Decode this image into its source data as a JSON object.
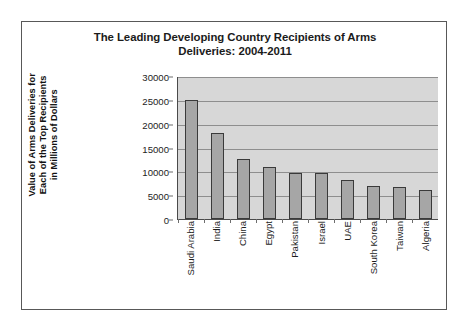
{
  "chart_data": {
    "type": "bar",
    "title": "The Leading Developing Country Recipients of Arms Deliveries: 2004-2011",
    "title_line1": "The Leading Developing Country Recipients of Arms",
    "title_line2": "Deliveries: 2004-2011",
    "xlabel": "",
    "ylabel": "Value of Arms Deliveries for Each of the Top Recipients in Millions of Dollars",
    "ylabel_line1": "Value of Arms Deliveries for",
    "ylabel_line2": "Each of the Top Recipients",
    "ylabel_line3": "in Millions of Dollars",
    "categories": [
      "Saudi Arabia",
      "India",
      "China",
      "Egypt",
      "Pakistan",
      "Israel",
      "UAE",
      "South Korea",
      "Taiwan",
      "Algeria"
    ],
    "values": [
      24900,
      18000,
      12500,
      11000,
      9600,
      9600,
      8200,
      6900,
      6800,
      6100
    ],
    "ylim": [
      0,
      30000
    ],
    "ytick_labels": [
      "30000",
      "25000",
      "20000",
      "15000",
      "10000",
      "5000",
      "0"
    ],
    "ytick_values": [
      30000,
      25000,
      20000,
      15000,
      10000,
      5000,
      0
    ],
    "grid": true,
    "legend": "none",
    "colors": {
      "bar_fill": "#a6a6a6",
      "bar_border": "#3a3a3a",
      "plot_background": "#d7d7d7",
      "gridline": "#8e8e8e",
      "axis": "#4a4a4a",
      "frame_border": "#585858",
      "text": "#1b1b1b",
      "page_background": "#ffffff"
    }
  }
}
